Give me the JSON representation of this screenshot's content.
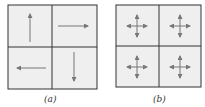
{
  "panels": [
    {
      "label": "(a)",
      "cells": [
        "arrow-up",
        "arrow-right",
        "arrow-left",
        "arrow-down"
      ]
    },
    {
      "label": "(b)",
      "cells": [
        "cross-arrows",
        "cross-arrows",
        "cross-arrows",
        "cross-arrows"
      ]
    }
  ],
  "colors": {
    "cell_fill": "#efefef",
    "border": "#333333",
    "arrow": "#777777"
  }
}
